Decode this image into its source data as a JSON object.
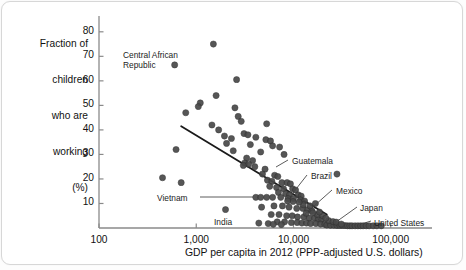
{
  "chart_data": {
    "type": "scatter",
    "title": "",
    "xlabel": "GDP per capita in 2012 (PPP-adjusted U.S. dollars)",
    "ylabel": "Fraction of children who are working (%)",
    "ylabel_lines": [
      "Fraction of",
      "children",
      "who are",
      "working",
      "(%)"
    ],
    "xscale": "log",
    "yscale": "linear",
    "xlim": [
      100,
      200000
    ],
    "ylim": [
      0,
      84
    ],
    "xticks": [
      100,
      1000,
      10000,
      100000
    ],
    "xtick_labels": [
      "100",
      "1,000",
      "10,000",
      "100,000"
    ],
    "yticks": [
      10,
      20,
      30,
      40,
      50,
      60,
      70,
      80
    ],
    "ytick_labels": [
      "10",
      "20",
      "30",
      "40",
      "50",
      "60",
      "70",
      "80"
    ],
    "grid": false,
    "legend": "none",
    "marker_color": "#4a4a4a",
    "trendline": {
      "x0": 700,
      "y0": 41.5,
      "x1": 22000,
      "y1": 5.5,
      "color": "#1a1a1a"
    },
    "annotations": [
      {
        "label": "Central African\nRepublic",
        "x": 600,
        "y": 66.5,
        "anchor": "right",
        "leader": false
      },
      {
        "label": "Vietnam",
        "x": 4100,
        "y": 12.5,
        "anchor": "right",
        "leader": true
      },
      {
        "label": "India",
        "x": 4400,
        "y": 2.0,
        "anchor": "right",
        "leader": false
      },
      {
        "label": "Guatemala",
        "x": 6600,
        "y": 20.5,
        "anchor": "left",
        "leader": true
      },
      {
        "label": "Brazil",
        "x": 11500,
        "y": 14.5,
        "anchor": "left",
        "leader": true
      },
      {
        "label": "Mexico",
        "x": 16000,
        "y": 2.0,
        "anchor": "left",
        "leader": true
      },
      {
        "label": "Japan",
        "x": 34000,
        "y": 1.2,
        "anchor": "left",
        "leader": true
      },
      {
        "label": "United States",
        "x": 51000,
        "y": 1.2,
        "anchor": "left",
        "leader": true
      }
    ],
    "points": [
      [
        1500,
        75
      ],
      [
        600,
        66.5
      ],
      [
        2600,
        60.5
      ],
      [
        1600,
        54
      ],
      [
        1100,
        51
      ],
      [
        1050,
        49.5
      ],
      [
        2500,
        49
      ],
      [
        780,
        47
      ],
      [
        2700,
        45.5
      ],
      [
        2900,
        43.5
      ],
      [
        5300,
        42.5
      ],
      [
        1450,
        42
      ],
      [
        1700,
        40
      ],
      [
        3100,
        38.5
      ],
      [
        3400,
        38
      ],
      [
        1950,
        37.5
      ],
      [
        4100,
        37
      ],
      [
        2300,
        36.5
      ],
      [
        5200,
        36
      ],
      [
        5800,
        35.5
      ],
      [
        620,
        32
      ],
      [
        2050,
        34.5
      ],
      [
        3600,
        34
      ],
      [
        6100,
        33.5
      ],
      [
        7200,
        33
      ],
      [
        2400,
        31.5
      ],
      [
        4600,
        31
      ],
      [
        8000,
        30
      ],
      [
        3300,
        28.5
      ],
      [
        3800,
        27.5
      ],
      [
        3150,
        26.5
      ],
      [
        3450,
        26
      ],
      [
        3050,
        25.5
      ],
      [
        4000,
        25
      ],
      [
        5100,
        24
      ],
      [
        450,
        20.5
      ],
      [
        700,
        18.5
      ],
      [
        4800,
        22
      ],
      [
        6400,
        21.5
      ],
      [
        6900,
        21
      ],
      [
        5400,
        19.5
      ],
      [
        6000,
        19
      ],
      [
        7600,
        18.5
      ],
      [
        8600,
        18.5
      ],
      [
        9300,
        18
      ],
      [
        5700,
        17
      ],
      [
        6700,
        16.5
      ],
      [
        7900,
        16
      ],
      [
        9800,
        16
      ],
      [
        10500,
        15.5
      ],
      [
        7000,
        14.5
      ],
      [
        8300,
        14
      ],
      [
        9100,
        13.5
      ],
      [
        11200,
        13.5
      ],
      [
        12000,
        13
      ],
      [
        4100,
        12.5
      ],
      [
        4600,
        12.5
      ],
      [
        5300,
        12.5
      ],
      [
        6100,
        12.5
      ],
      [
        7400,
        12.5
      ],
      [
        8800,
        12
      ],
      [
        10000,
        12
      ],
      [
        11800,
        11.5
      ],
      [
        13000,
        11
      ],
      [
        2000,
        7.5
      ],
      [
        4700,
        8.5
      ],
      [
        6300,
        9
      ],
      [
        7700,
        9
      ],
      [
        9000,
        8.5
      ],
      [
        10800,
        8
      ],
      [
        12500,
        8
      ],
      [
        14000,
        7.5
      ],
      [
        15500,
        7
      ],
      [
        5900,
        5.5
      ],
      [
        7100,
        5.5
      ],
      [
        8500,
        5
      ],
      [
        9700,
        5
      ],
      [
        11000,
        4.5
      ],
      [
        12800,
        4.5
      ],
      [
        14500,
        4
      ],
      [
        16500,
        4
      ],
      [
        18000,
        3.5
      ],
      [
        19500,
        3.5
      ],
      [
        6800,
        2.5
      ],
      [
        8100,
        2.5
      ],
      [
        9500,
        2.2
      ],
      [
        10900,
        2.2
      ],
      [
        12200,
        2
      ],
      [
        13600,
        2
      ],
      [
        15000,
        1.8
      ],
      [
        17000,
        1.8
      ],
      [
        19000,
        1.6
      ],
      [
        21000,
        1.5
      ],
      [
        4400,
        2.0
      ],
      [
        5500,
        1.8
      ],
      [
        6200,
        1.5
      ],
      [
        7500,
        1.4
      ],
      [
        22000,
        1.2
      ],
      [
        24000,
        1.1
      ],
      [
        26000,
        1.1
      ],
      [
        28000,
        1.0
      ],
      [
        30000,
        1.0
      ],
      [
        32000,
        1.0
      ],
      [
        34000,
        1.0
      ],
      [
        36000,
        0.9
      ],
      [
        38000,
        0.9
      ],
      [
        40000,
        0.9
      ],
      [
        43000,
        0.9
      ],
      [
        46000,
        0.9
      ],
      [
        49000,
        0.9
      ],
      [
        52000,
        0.9
      ],
      [
        56000,
        0.9
      ],
      [
        60000,
        0.9
      ],
      [
        66000,
        0.9
      ],
      [
        72000,
        0.9
      ],
      [
        80000,
        0.9
      ],
      [
        23000,
        3.0
      ],
      [
        25500,
        2.6
      ],
      [
        27500,
        2.4
      ],
      [
        31000,
        1.6
      ],
      [
        17500,
        5.5
      ],
      [
        20000,
        5.0
      ],
      [
        21500,
        4.0
      ],
      [
        18500,
        6.5
      ],
      [
        13500,
        6.0
      ],
      [
        15800,
        6.2
      ],
      [
        12600,
        9.5
      ],
      [
        14800,
        9.0
      ],
      [
        16800,
        10.0
      ],
      [
        11400,
        10.5
      ],
      [
        9900,
        10.8
      ],
      [
        8700,
        11.0
      ],
      [
        28000,
        22.0
      ]
    ]
  }
}
